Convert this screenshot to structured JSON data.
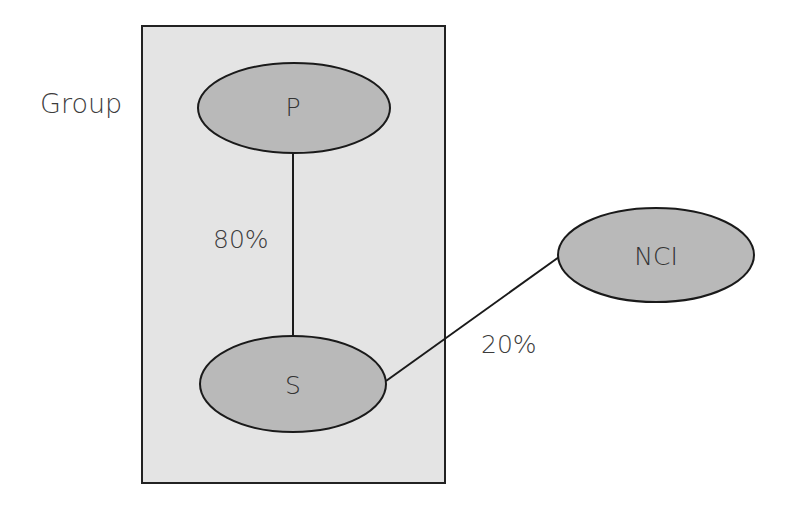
{
  "diagram": {
    "group": {
      "label": "Group",
      "fill": "#e4e4e4",
      "stroke": "#222222"
    },
    "nodes": [
      {
        "id": "P",
        "label": "P",
        "fill": "#b9b9b9"
      },
      {
        "id": "S",
        "label": "S",
        "fill": "#b9b9b9"
      },
      {
        "id": "NCI",
        "label": "NCI",
        "fill": "#b9b9b9"
      }
    ],
    "edges": [
      {
        "from": "P",
        "to": "S",
        "label": "80%"
      },
      {
        "from": "S",
        "to": "NCI",
        "label": "20%"
      }
    ]
  }
}
